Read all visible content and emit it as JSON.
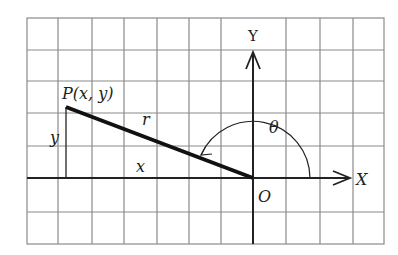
{
  "diagram": {
    "type": "polar-coordinates-figure",
    "labels": {
      "point": "P(x, y)",
      "radius": "r",
      "angle": "θ",
      "x_leg": "x",
      "y_leg": "y",
      "origin": "O",
      "x_axis": "X",
      "y_axis": "Y"
    },
    "grid": {
      "columns": 11,
      "rows": 7,
      "line_color": "#8a8a8a"
    },
    "colors": {
      "axis": "#222222",
      "segment": "#111111",
      "background": "#ffffff"
    }
  }
}
